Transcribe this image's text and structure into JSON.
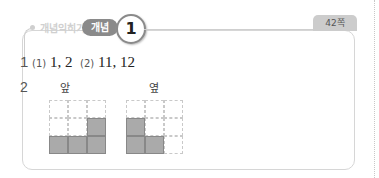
{
  "header": {
    "section_label": "개념익히기",
    "tag_label": "개념",
    "number": "1",
    "page": "42쪽"
  },
  "answers": {
    "q1": {
      "number": "1",
      "part1_label": "(1)",
      "part1_value": "1, 2",
      "part2_label": "(2)",
      "part2_value": "11, 12"
    },
    "q2": {
      "number": "2",
      "front_label": "앞",
      "side_label": "옆",
      "front_grid": [
        [
          0,
          0,
          0
        ],
        [
          0,
          0,
          1
        ],
        [
          1,
          1,
          1
        ]
      ],
      "side_grid": [
        [
          0,
          0,
          0
        ],
        [
          1,
          0,
          0
        ],
        [
          1,
          1,
          0
        ]
      ]
    }
  },
  "colors": {
    "filled_cell": "#aaaaaa",
    "tag_bg": "#8a8a8a",
    "border": "#d6d6d6"
  }
}
